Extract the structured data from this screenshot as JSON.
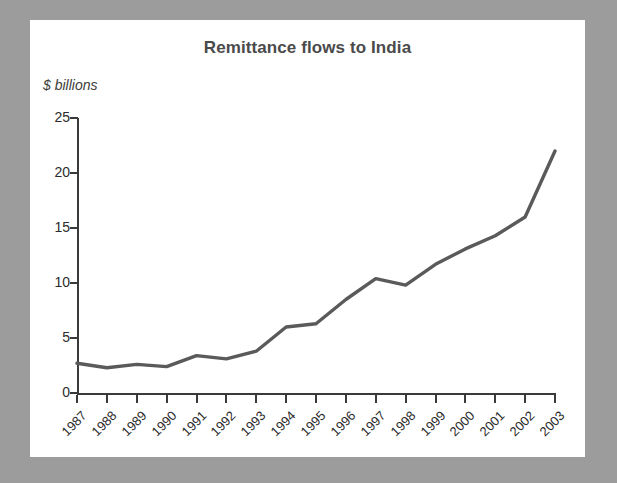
{
  "chart_data": {
    "type": "line",
    "title": "Remittance flows to India",
    "ylabel": "$ billions",
    "xlabel": "",
    "categories": [
      "1987",
      "1988",
      "1989",
      "1990",
      "1991",
      "1992",
      "1993",
      "1994",
      "1995",
      "1996",
      "1997",
      "1998",
      "1999",
      "2000",
      "2001",
      "2002",
      "2003"
    ],
    "values": [
      2.7,
      2.3,
      2.6,
      2.4,
      3.4,
      3.1,
      3.8,
      6.0,
      6.3,
      8.5,
      10.4,
      9.8,
      11.7,
      13.1,
      14.3,
      16.0,
      22.0
    ],
    "series": [
      {
        "name": "Remittance flows to India",
        "values": [
          2.7,
          2.3,
          2.6,
          2.4,
          3.4,
          3.1,
          3.8,
          6.0,
          6.3,
          8.5,
          10.4,
          9.8,
          11.7,
          13.1,
          14.3,
          16.0,
          22.0
        ]
      }
    ],
    "ylim": [
      0,
      25
    ],
    "yticks": [
      0,
      5,
      10,
      15,
      20,
      25
    ],
    "ytick_labels": [
      "0",
      "5",
      "10",
      "15",
      "20",
      "25"
    ],
    "grid": false,
    "legend": false,
    "legend_position": "none",
    "line_color": "#5a5a5a",
    "axis_color": "#3a3a3a",
    "title_color": "#4a4a4a",
    "background_color": "#ffffff",
    "frame_color": "#9c9c9c",
    "xtick_label_rotation": -45
  }
}
